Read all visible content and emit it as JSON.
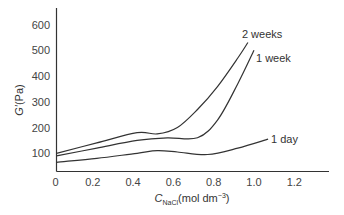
{
  "chart_data": {
    "type": "line",
    "title": "",
    "xlabel": {
      "main": "C",
      "subscript": "NaCl",
      "units": "(mol dm",
      "exponent": "−3",
      "close": ")"
    },
    "ylabel": {
      "main": "G′",
      "units": "(Pa)"
    },
    "xlim": [
      0,
      1.35
    ],
    "ylim": [
      30,
      650
    ],
    "grid": false,
    "x_ticks": [
      0,
      0.2,
      0.4,
      0.6,
      0.8,
      1.0,
      1.2
    ],
    "x_tick_labels": [
      "0",
      "0.2",
      "0.4",
      "0.6",
      "0.8",
      "1.0",
      "1.2"
    ],
    "y_ticks": [
      100,
      200,
      300,
      400,
      500,
      600
    ],
    "y_tick_labels": [
      "100",
      "200",
      "300",
      "400",
      "500",
      "600"
    ],
    "legend_placement": "inline labels at curve ends",
    "series": [
      {
        "name": "2 weeks",
        "x": [
          0,
          0.2,
          0.4,
          0.5,
          0.6,
          0.7,
          0.8,
          0.9,
          0.95
        ],
        "y": [
          100,
          140,
          180,
          175,
          200,
          270,
          360,
          470,
          530
        ]
      },
      {
        "name": "1 week",
        "x": [
          0,
          0.2,
          0.4,
          0.55,
          0.7,
          0.8,
          0.9,
          0.98
        ],
        "y": [
          90,
          120,
          150,
          160,
          160,
          230,
          370,
          500
        ]
      },
      {
        "name": "1 day",
        "x": [
          0,
          0.2,
          0.4,
          0.5,
          0.6,
          0.75,
          0.9,
          1.05
        ],
        "y": [
          65,
          80,
          100,
          110,
          105,
          95,
          120,
          155
        ]
      }
    ]
  }
}
